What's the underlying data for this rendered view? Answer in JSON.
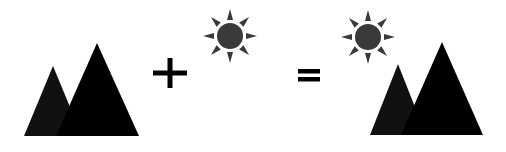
{
  "diagram": {
    "description": "Mountains plus sun equals mountains with sun",
    "colors": {
      "background": "#ffffff",
      "mountain_back": "#111111",
      "mountain_front": "#000000",
      "sun": "#3a3a3a",
      "operator": "#000000"
    },
    "terms": [
      {
        "id": "term-1",
        "label": "mountains",
        "icon": "mountains-icon"
      },
      {
        "id": "operator-plus",
        "label": "+",
        "icon": "plus-icon"
      },
      {
        "id": "term-2",
        "label": "sun",
        "icon": "sun-icon"
      },
      {
        "id": "operator-equals",
        "label": "=",
        "icon": "equals-icon"
      },
      {
        "id": "result",
        "label": "mountains with sun",
        "icon": "mountains-with-sun-icon"
      }
    ]
  }
}
